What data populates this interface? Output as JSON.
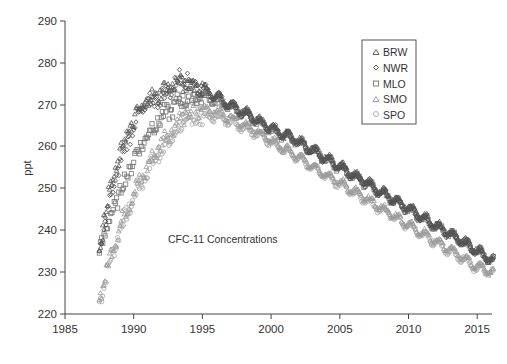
{
  "chart_data": {
    "type": "scatter",
    "title": "",
    "annotation": "CFC-11 Concentrations",
    "xlabel": "",
    "ylabel": "ppt",
    "xlim": [
      1985,
      2016
    ],
    "ylim": [
      220,
      290
    ],
    "xticks": [
      1985,
      1990,
      1995,
      2000,
      2005,
      2010,
      2015
    ],
    "yticks": [
      220,
      230,
      240,
      250,
      260,
      270,
      280,
      290
    ],
    "grid": false,
    "legend_position": "upper right",
    "series": [
      {
        "name": "BRW",
        "marker": "triangle",
        "color": "#555555",
        "x": [
          1987.5,
          1988,
          1988.5,
          1989,
          1989.5,
          1990,
          1990.5,
          1991,
          1991.5,
          1992,
          1992.5,
          1993,
          1993.5,
          1994,
          1995,
          1996,
          1997,
          1998,
          1999,
          2000,
          2001,
          2002,
          2003,
          2004,
          2005,
          2006,
          2007,
          2008,
          2009,
          2010,
          2011,
          2012,
          2013,
          2014,
          2015,
          2016
        ],
        "y": [
          236,
          246,
          252,
          258,
          263,
          266,
          269,
          271,
          272,
          273,
          274,
          275,
          275,
          275,
          274,
          272,
          270,
          268.5,
          266.5,
          264.5,
          263,
          261.5,
          259.5,
          257.5,
          255.5,
          253.5,
          251.5,
          249.5,
          247.5,
          245.5,
          243.5,
          241.5,
          239.5,
          237.5,
          235.5,
          233
        ]
      },
      {
        "name": "NWR",
        "marker": "diamond",
        "color": "#444444",
        "x": [
          1987.5,
          1988,
          1988.5,
          1989,
          1989.5,
          1990,
          1990.5,
          1991,
          1991.5,
          1992,
          1992.5,
          1993,
          1993.5,
          1994,
          1995,
          1996,
          1997,
          1998,
          1999,
          2000,
          2001,
          2002,
          2003,
          2004,
          2005,
          2006,
          2007,
          2008,
          2009,
          2010,
          2011,
          2012,
          2013,
          2014,
          2015,
          2016
        ],
        "y": [
          234,
          243,
          250,
          256,
          261,
          265,
          268,
          270,
          271,
          272,
          273,
          275,
          277,
          276,
          274,
          272,
          270,
          268,
          266,
          264.5,
          263,
          261,
          259,
          257,
          255,
          253,
          251,
          249,
          247,
          245,
          243,
          241,
          239,
          237,
          235,
          233
        ]
      },
      {
        "name": "MLO",
        "marker": "square",
        "color": "#777777",
        "x": [
          1987.5,
          1988,
          1988.5,
          1989,
          1989.5,
          1990,
          1990.5,
          1991,
          1991.5,
          1992,
          1992.5,
          1993,
          1993.5,
          1994,
          1995,
          1996,
          1997,
          1998,
          1999,
          2000,
          2001,
          2002,
          2003,
          2004,
          2005,
          2006,
          2007,
          2008,
          2009,
          2010,
          2011,
          2012,
          2013,
          2014,
          2015,
          2016
        ],
        "y": [
          236,
          240,
          245,
          249,
          253,
          257,
          260,
          263,
          265,
          267,
          268,
          270,
          271,
          272,
          272,
          271,
          269.5,
          268,
          266,
          264,
          262.5,
          261,
          259,
          257,
          255,
          253,
          251,
          249,
          247,
          245,
          243,
          241,
          239,
          237,
          235,
          233
        ]
      },
      {
        "name": "SMO",
        "marker": "triangle",
        "color": "#999999",
        "x": [
          1987.5,
          1988,
          1988.5,
          1989,
          1989.5,
          1990,
          1990.5,
          1991,
          1991.5,
          1992,
          1992.5,
          1993,
          1993.5,
          1994,
          1995,
          1996,
          1997,
          1998,
          1999,
          2000,
          2001,
          2002,
          2003,
          2004,
          2005,
          2006,
          2007,
          2008,
          2009,
          2010,
          2011,
          2012,
          2013,
          2014,
          2015,
          2016
        ],
        "y": [
          224,
          230,
          236,
          241,
          245,
          249,
          252,
          255,
          258,
          261,
          263,
          265,
          267,
          268,
          269,
          268.5,
          267,
          265.5,
          263.5,
          261.5,
          259.5,
          257.5,
          255.5,
          253.5,
          251.5,
          249.5,
          247.5,
          245.5,
          243.5,
          241.5,
          239.5,
          237.5,
          235.5,
          233.5,
          231.5,
          230
        ]
      },
      {
        "name": "SPO",
        "marker": "circle",
        "color": "#aaaaaa",
        "x": [
          1987.5,
          1988,
          1988.5,
          1989,
          1989.5,
          1990,
          1990.5,
          1991,
          1991.5,
          1992,
          1992.5,
          1993,
          1993.5,
          1994,
          1995,
          1996,
          1997,
          1998,
          1999,
          2000,
          2001,
          2002,
          2003,
          2004,
          2005,
          2006,
          2007,
          2008,
          2009,
          2010,
          2011,
          2012,
          2013,
          2014,
          2015,
          2016
        ],
        "y": [
          223,
          229,
          235,
          240,
          244,
          248,
          251,
          254,
          257,
          259,
          261,
          263,
          265,
          266,
          267,
          267,
          266,
          264.5,
          263,
          261,
          259,
          257,
          255,
          253,
          251,
          249,
          247,
          245,
          243,
          241,
          239,
          237,
          235,
          233,
          231,
          230
        ]
      }
    ]
  },
  "legend": {
    "items": [
      {
        "label": "BRW",
        "marker": "triangle"
      },
      {
        "label": "NWR",
        "marker": "diamond"
      },
      {
        "label": "MLO",
        "marker": "square"
      },
      {
        "label": "SMO",
        "marker": "triangle"
      },
      {
        "label": "SPO",
        "marker": "circle"
      }
    ]
  },
  "axes": {
    "ylabel": "ppt",
    "annotation": "CFC-11 Concentrations",
    "x_ticks": [
      "1985",
      "1990",
      "1995",
      "2000",
      "2005",
      "2010",
      "2015"
    ],
    "y_ticks": [
      "290",
      "280",
      "270",
      "260",
      "250",
      "240",
      "230",
      "220"
    ]
  }
}
